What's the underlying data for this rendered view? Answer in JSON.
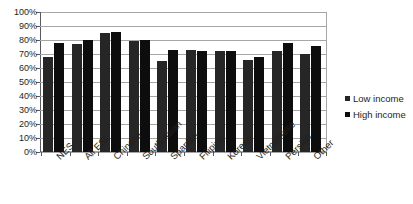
{
  "chart_data": {
    "type": "bar",
    "title": "",
    "subtitle": "",
    "xlabel": "",
    "ylabel": "",
    "ylim": [
      0,
      100
    ],
    "y_tick_labels": [
      "100%",
      "90%",
      "80%",
      "70%",
      "60%",
      "50%",
      "40%",
      "30%",
      "20%",
      "10%",
      "0%"
    ],
    "y_tick_values": [
      100,
      90,
      80,
      70,
      60,
      50,
      40,
      30,
      20,
      10,
      0
    ],
    "grid": "horizontal",
    "legend_position": "right",
    "categories": [
      "NES",
      "All ESL",
      "Chinese",
      "South Asian",
      "Spanish",
      "Filipino",
      "Korean",
      "Vietnamese",
      "Persian",
      "Other"
    ],
    "series": [
      {
        "name": "Low income",
        "color": "#262626",
        "values": [
          68,
          77,
          85,
          79,
          65,
          73,
          72,
          66,
          72,
          70
        ]
      },
      {
        "name": "High income",
        "color": "#0d0d0d",
        "values": [
          78,
          80,
          86,
          80,
          73,
          72,
          72,
          68,
          78,
          76
        ]
      }
    ]
  },
  "colors": {
    "low_income": "#262626",
    "high_income": "#0d0d0d",
    "gridline": "#a6a6a6",
    "axis": "#5a5a5a",
    "text": "#231f20",
    "background": "#ffffff"
  }
}
